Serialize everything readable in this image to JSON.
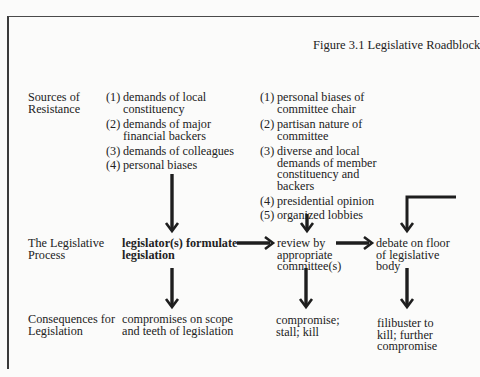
{
  "figure": {
    "title": "Figure 3.1  Legislative Roadblock"
  },
  "rows": {
    "sources": {
      "label_line1": "Sources of",
      "label_line2": "Resistance"
    },
    "process": {
      "label_line1": "The Legislative",
      "label_line2": "Process"
    },
    "consequences": {
      "label_line1": "Consequences for",
      "label_line2": "Legislation"
    }
  },
  "legislator_column": {
    "sources": [
      {
        "num": "(1)",
        "line1": "demands of local",
        "line2": "constituency"
      },
      {
        "num": "(2)",
        "line1": "demands of major",
        "line2": "financial backers"
      },
      {
        "num": "(3)",
        "line1": "demands of colleagues",
        "line2": ""
      },
      {
        "num": "(4)",
        "line1": "personal biases",
        "line2": ""
      }
    ],
    "process_line1": "legislator(s) formulate",
    "process_line2": "legislation",
    "consequence_line1": "compromises  on  scope",
    "consequence_line2": "and  teeth  of  legislation"
  },
  "committee_column": {
    "sources": [
      {
        "num": "(1)",
        "lines": [
          "personal biases of",
          "committee chair"
        ]
      },
      {
        "num": "(2)",
        "lines": [
          "partisan nature of",
          "committee"
        ]
      },
      {
        "num": "(3)",
        "lines": [
          "diverse and local",
          "demands of member",
          "constituency and",
          "backers"
        ]
      },
      {
        "num": "(4)",
        "lines": [
          "presidential opinion"
        ]
      },
      {
        "num": "(5)",
        "lines": [
          "organized lobbies"
        ]
      }
    ],
    "process_line1": "review  by",
    "process_line2": "appropriate",
    "process_line3": "committee(s)",
    "consequence_line1": "compromise;",
    "consequence_line2": "stall;  kill"
  },
  "floor_column": {
    "process_line1": "debate on floor",
    "process_line2": "of legislative",
    "process_line3": "body",
    "consequence_line1": "filibuster  to",
    "consequence_line2": "kill;  further",
    "consequence_line3": "compromise"
  },
  "colors": {
    "ink": "#1e1e1e",
    "paper": "#fbfbfa"
  }
}
